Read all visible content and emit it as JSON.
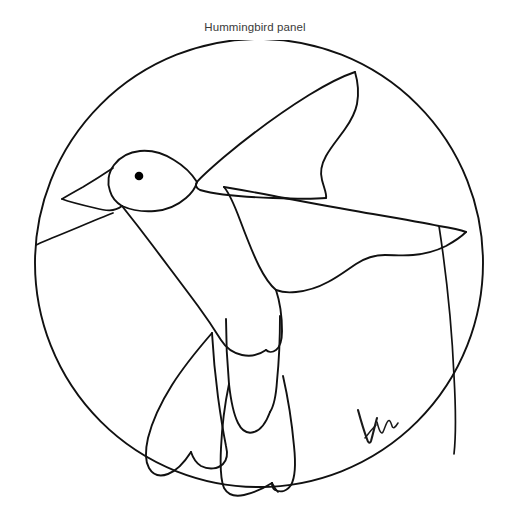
{
  "page": {
    "title": "Hummingbird panel",
    "background_color": "#ffffff",
    "width": 510,
    "height": 514
  },
  "artwork": {
    "name": "hummingbird-line-drawing",
    "description": "Black line-art pattern of a hummingbird in flight enclosed in a circle",
    "style": "stained-glass pattern outline",
    "line_color": "#111111",
    "fill_color": "none",
    "border_shape": "circle",
    "circle": {
      "center_x": 259,
      "center_y": 235,
      "radius": 224
    },
    "parts": [
      {
        "name": "circle-border",
        "label": "Circular panel border"
      },
      {
        "name": "bird-head",
        "label": "Head"
      },
      {
        "name": "bird-beak",
        "label": "Long slender beak"
      },
      {
        "name": "bird-eye",
        "label": "Eye"
      },
      {
        "name": "bird-body",
        "label": "Body"
      },
      {
        "name": "upper-wing",
        "label": "Upper raised wing"
      },
      {
        "name": "lower-wing",
        "label": "Lower outstretched wing"
      },
      {
        "name": "tail-feather-left",
        "label": "Left tail feather"
      },
      {
        "name": "tail-feather-center",
        "label": "Center tail feather"
      },
      {
        "name": "tail-feather-right",
        "label": "Right tail feather"
      },
      {
        "name": "background-lead-line-left",
        "label": "Background lead line (left)"
      },
      {
        "name": "background-lead-line-right",
        "label": "Background lead line (right)"
      }
    ]
  },
  "signature": {
    "name": "artist-signature",
    "text": "Vu",
    "position": "bottom-right",
    "color": "#1a1a1a"
  }
}
